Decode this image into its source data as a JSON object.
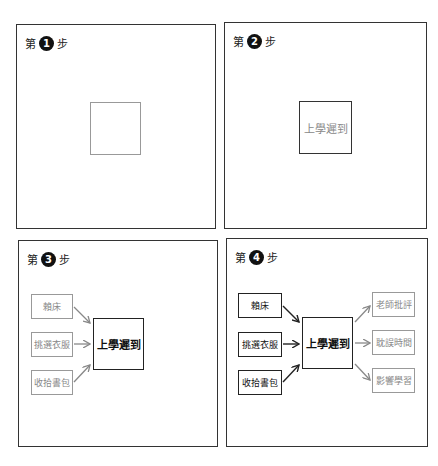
{
  "panels": [
    {
      "step_prefix": "第",
      "step_number": "1",
      "step_suffix": "步",
      "center_label": ""
    },
    {
      "step_prefix": "第",
      "step_number": "2",
      "step_suffix": "步",
      "center_label": "上學遲到"
    },
    {
      "step_prefix": "第",
      "step_number": "3",
      "step_suffix": "步",
      "center_label": "上學遲到",
      "causes": [
        "賴床",
        "挑選衣服",
        "收拾書包"
      ]
    },
    {
      "step_prefix": "第",
      "step_number": "4",
      "step_suffix": "步",
      "center_label": "上學遲到",
      "causes": [
        "賴床",
        "挑選衣服",
        "收拾書包"
      ],
      "effects": [
        "老師批評",
        "耽誤時間",
        "影響學習"
      ]
    }
  ],
  "colors": {
    "border_dark": "#222222",
    "border_gray": "#999999",
    "text_gray": "#888888"
  }
}
